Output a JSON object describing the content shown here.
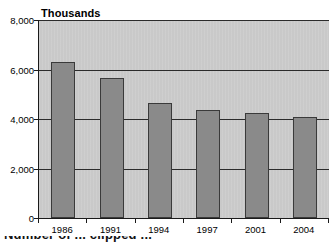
{
  "chart_data": {
    "type": "bar",
    "title": "Thousands",
    "xlabel": "",
    "ylabel": "",
    "categories": [
      "1986",
      "1991",
      "1994",
      "1997",
      "2001",
      "2004"
    ],
    "values": [
      6300,
      5650,
      4650,
      4350,
      4250,
      4100
    ],
    "ylim": [
      0,
      8000
    ],
    "ytick_labels": [
      "0",
      "2,000",
      "4,000",
      "6,000",
      "8,000"
    ],
    "ytick_values": [
      0,
      2000,
      4000,
      6000,
      8000
    ],
    "grid": true,
    "grid_axis": "y",
    "legend": null,
    "series": [
      {
        "name": "Thousands",
        "values": [
          6300,
          5650,
          4650,
          4350,
          4250,
          4100
        ]
      }
    ],
    "colors": {
      "bar_fill": "#8a8a8a",
      "bar_stroke": "#3a3a3a",
      "plot_background": "#c9c9c9",
      "gridline": "#2b2b2b",
      "axis": "#1a1a1a",
      "text": "#000000",
      "page_background": "#ffffff"
    }
  },
  "caption": {
    "text": "Number of ... clipped ..."
  }
}
